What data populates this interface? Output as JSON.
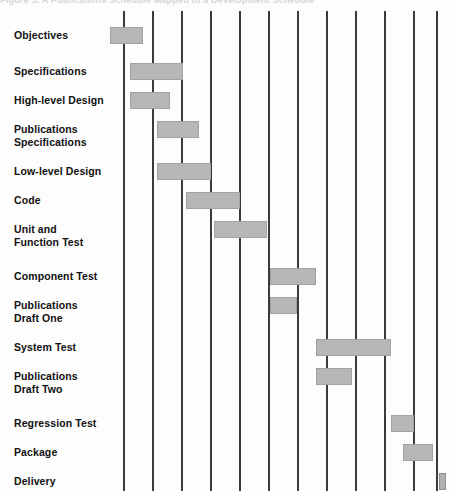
{
  "caption": {
    "text": "Figure 3.  A Publications Schedule Mapped to a Development Schedule"
  },
  "chart_data": {
    "type": "bar",
    "subtype": "gantt",
    "title": "Figure 3.  A Publications Schedule Mapped to a Development Schedule",
    "xlabel": "",
    "ylabel": "",
    "grid": true,
    "legend": false,
    "orientation": "horizontal",
    "x_axis": {
      "label": "",
      "tick_labels": [],
      "gridline_count": 12,
      "gridline_positions": [
        124,
        153,
        182,
        211,
        240,
        269,
        298,
        327,
        356,
        385,
        414,
        437
      ],
      "units": "time periods",
      "range": [
        0,
        12
      ]
    },
    "bar_color": "#b7b7b7",
    "bar_border_color": "#a2a2a2",
    "gridline_color": "#3a3a3a",
    "categories": [
      "Objectives",
      "Specifications",
      "High-level Design",
      "Publications Specifications",
      "Low-level Design",
      "Code",
      "Unit and Function Test",
      "Component Test",
      "Publications Draft One",
      "System Test",
      "Publications Draft Two",
      "Regression Test",
      "Package",
      "Delivery"
    ],
    "tasks": [
      {
        "name": "Objectives",
        "label_line1": "Objectives",
        "label_line2": "",
        "start": 110,
        "end": 143,
        "row_y": 16,
        "milestone": false
      },
      {
        "name": "Specifications",
        "label_line1": "Specifications",
        "label_line2": "",
        "start": 130,
        "end": 183,
        "row_y": 52,
        "milestone": false
      },
      {
        "name": "High-level Design",
        "label_line1": "High-level Design",
        "label_line2": "",
        "start": 130,
        "end": 170,
        "row_y": 81,
        "milestone": false
      },
      {
        "name": "Publications Specifications",
        "label_line1": "Publications",
        "label_line2": "Specifications",
        "start": 157,
        "end": 199,
        "row_y": 110,
        "milestone": false
      },
      {
        "name": "Low-level Design",
        "label_line1": "Low-level Design",
        "label_line2": "",
        "start": 157,
        "end": 211,
        "row_y": 152,
        "milestone": false
      },
      {
        "name": "Code",
        "label_line1": "Code",
        "label_line2": "",
        "start": 186,
        "end": 240,
        "row_y": 181,
        "milestone": false
      },
      {
        "name": "Unit and Function Test",
        "label_line1": "Unit and",
        "label_line2": "Function Test",
        "start": 214,
        "end": 267,
        "row_y": 210,
        "milestone": false
      },
      {
        "name": "Component Test",
        "label_line1": "Component Test",
        "label_line2": "",
        "start": 270,
        "end": 316,
        "row_y": 257,
        "milestone": false
      },
      {
        "name": "Publications Draft One",
        "label_line1": "Publications",
        "label_line2": "Draft One",
        "start": 270,
        "end": 297,
        "row_y": 286,
        "milestone": false
      },
      {
        "name": "System Test",
        "label_line1": "System Test",
        "label_line2": "",
        "start": 316,
        "end": 391,
        "row_y": 328,
        "milestone": false
      },
      {
        "name": "Publications Draft Two",
        "label_line1": "Publications",
        "label_line2": "Draft  Two",
        "start": 316,
        "end": 352,
        "row_y": 357,
        "milestone": false
      },
      {
        "name": "Regression Test",
        "label_line1": "Regression Test",
        "label_line2": "",
        "start": 391,
        "end": 414,
        "row_y": 404,
        "milestone": false
      },
      {
        "name": "Package",
        "label_line1": "Package",
        "label_line2": "",
        "start": 403,
        "end": 433,
        "row_y": 433,
        "milestone": false
      },
      {
        "name": "Delivery",
        "label_line1": "Delivery",
        "label_line2": "",
        "start": 439,
        "end": 446,
        "row_y": 462,
        "milestone": true
      }
    ]
  }
}
